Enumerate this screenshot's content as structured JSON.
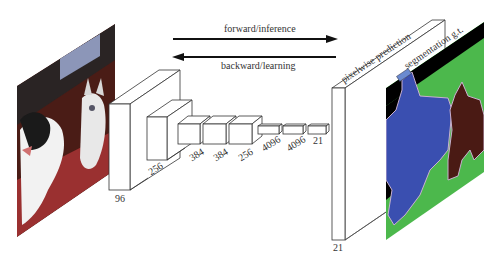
{
  "arrows": {
    "forward_label": "forward/inference",
    "backward_label": "backward/learning"
  },
  "layers": [
    {
      "label": "96"
    },
    {
      "label": "256"
    },
    {
      "label": "384"
    },
    {
      "label": "384"
    },
    {
      "label": "256"
    },
    {
      "label": "4096"
    },
    {
      "label": "4096"
    },
    {
      "label": "21"
    }
  ],
  "prediction": {
    "label": "pixelwise prediction",
    "depth_label": "21"
  },
  "ground_truth": {
    "label": "segmentation g.t."
  },
  "colors": {
    "background": "#000000",
    "dog": "#3a4fb0",
    "cat": "#4a1a14",
    "floor": "#4cb84c",
    "outline": "#c9b0d0"
  }
}
